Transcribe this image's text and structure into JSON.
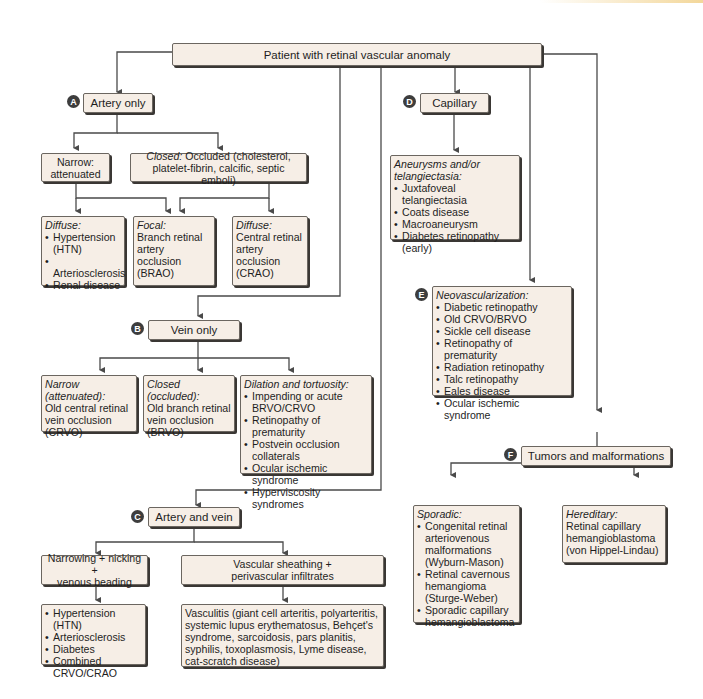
{
  "colors": {
    "box_fill": "#f6eee6",
    "box_border": "#6b6660",
    "shadow": "#3a3734",
    "line": "#4a4a4a",
    "badge": "#3d3d3d"
  },
  "root": {
    "label": "Patient with retinal vascular anomaly"
  },
  "A": {
    "badge": "A",
    "label": "Artery only",
    "narrow": {
      "line1": "Narrow:",
      "line2": "attenuated"
    },
    "closed": {
      "hdr": "Closed:",
      "text": " Occluded (cholesterol, platelet-fibrin, calcific, septic emboli)"
    },
    "diffuse1": {
      "hdr": "Diffuse:",
      "items": [
        "Hypertension (HTN)",
        "Arteriosclerosis",
        "Renal disease"
      ]
    },
    "focal": {
      "hdr": "Focal:",
      "text": "Branch retinal artery occlusion (BRAO)"
    },
    "diffuse2": {
      "hdr": "Diffuse:",
      "text": "Central retinal artery occlusion (CRAO)"
    }
  },
  "B": {
    "badge": "B",
    "label": "Vein only",
    "narrow": {
      "hdr": "Narrow (attenuated):",
      "text": "Old central retinal vein occlusion (CRVO)"
    },
    "closed": {
      "hdr": "Closed (occluded):",
      "text": "Old branch retinal vein occlusion (BRVO)"
    },
    "dilation": {
      "hdr": "Dilation and tortuosity:",
      "items": [
        "Impending or acute BRVO/CRVO",
        "Retinopathy of prematurity",
        "Postvein occlusion collaterals",
        "Ocular ischemic syndrome",
        "Hyperviscosity syndromes"
      ]
    }
  },
  "C": {
    "badge": "C",
    "label": "Artery and vein",
    "narrowing": {
      "line1": "Narrowing + nicking +",
      "line2": "venous beading"
    },
    "sheathing": {
      "line1": "Vascular sheathing +",
      "line2": "perivascular infiltrates"
    },
    "narrowing_items": [
      "Hypertension (HTN)",
      "Arteriosclerosis",
      "Diabetes",
      "Combined CRVO/CRAO"
    ],
    "vasculitis": "Vasculitis (giant cell arteritis, polyarteritis, systemic lupus erythematosus, Behçet's syndrome, sarcoidosis, pars planitis, syphilis, toxoplasmosis, Lyme disease, cat-scratch disease)"
  },
  "D": {
    "badge": "D",
    "label": "Capillary",
    "aneurysm": {
      "hdr": "Aneurysms and/or telangiectasia:",
      "items": [
        "Juxtafoveal telangiectasia",
        "Coats disease",
        "Macroaneurysm",
        "Diabetes retinopathy (early)"
      ]
    }
  },
  "E": {
    "badge": "E",
    "neo": {
      "hdr": "Neovascularization:",
      "items": [
        "Diabetic retinopathy",
        "Old CRVO/BRVO",
        "Sickle cell disease",
        "Retinopathy of prematurity",
        "Radiation retinopathy",
        "Talc retinopathy",
        "Eales disease",
        "Ocular ischemic syndrome"
      ]
    }
  },
  "F": {
    "badge": "F",
    "label": "Tumors and malformations",
    "sporadic": {
      "hdr": "Sporadic:",
      "items": [
        "Congenital retinal arteriovenous malformations (Wyburn-Mason)",
        "Retinal cavernous hemangioma (Sturge-Weber)",
        "Sporadic capillary hemangioblastoma"
      ]
    },
    "hereditary": {
      "hdr": "Hereditary:",
      "text": "Retinal capillary hemangioblastoma (von Hippel-Lindau)"
    }
  }
}
